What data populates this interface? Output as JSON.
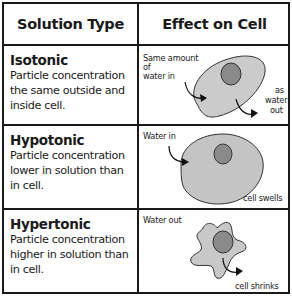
{
  "header": {
    "solution_type": "Solution Type",
    "effect_on_cell": "Effect on Cell"
  },
  "rows": [
    {
      "type": "Isotonic",
      "description": "Particle concentration the same outside and inside cell.",
      "labels": [
        "Same amount of water in",
        "as water out"
      ],
      "label_parts": {
        "in_1": "Same amount",
        "in_2": "of",
        "in_3": "water in",
        "out_1": "as",
        "out_2": "water",
        "out_3": "out"
      }
    },
    {
      "type": "Hypotonic",
      "description": "Particle concentration lower in solution than in cell.",
      "labels": [
        "Water in",
        "cell swells"
      ]
    },
    {
      "type": "Hypertonic",
      "description": "Particle concentration higher in solution than in cell.",
      "labels": [
        "Water out",
        "cell shrinks"
      ]
    }
  ],
  "colors": {
    "border": "#1a1a1a",
    "cell_fill": "#c8c8c8",
    "nucleus_fill": "#8a8a8a"
  }
}
